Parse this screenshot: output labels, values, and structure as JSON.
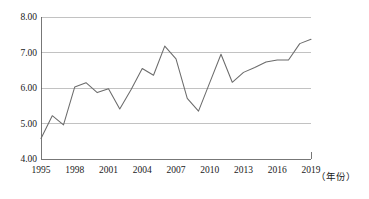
{
  "chart_data": {
    "type": "line",
    "title": "",
    "subtitle": "",
    "xlabel": "（年份）",
    "ylabel": "",
    "grid": true,
    "legend": false,
    "xlim": [
      1995,
      2019
    ],
    "ylim": [
      4.0,
      8.0
    ],
    "x_tick_labels": [
      "1995",
      "1998",
      "2001",
      "2004",
      "2007",
      "2010",
      "2013",
      "2016",
      "2019"
    ],
    "x_tick_values": [
      1995,
      1998,
      2001,
      2004,
      2007,
      2010,
      2013,
      2016,
      2019
    ],
    "y_tick_labels": [
      "4.00",
      "5.00",
      "6.00",
      "7.00",
      "8.00"
    ],
    "y_tick_values": [
      4.0,
      5.0,
      6.0,
      7.0,
      8.0
    ],
    "x": [
      1995,
      1996,
      1997,
      1998,
      1999,
      2000,
      2001,
      2002,
      2003,
      2004,
      2005,
      2006,
      2007,
      2008,
      2009,
      2010,
      2011,
      2012,
      2013,
      2014,
      2015,
      2016,
      2017,
      2018,
      2019
    ],
    "series": [
      {
        "name": "value",
        "color": "#6b6b6b",
        "values": [
          4.58,
          5.22,
          4.96,
          6.03,
          6.15,
          5.87,
          5.98,
          5.41,
          5.95,
          6.55,
          6.36,
          7.18,
          6.82,
          5.71,
          5.35,
          6.15,
          6.95,
          6.16,
          6.44,
          6.58,
          6.73,
          6.79,
          6.79,
          7.25,
          7.37
        ]
      }
    ],
    "values": [
      4.58,
      5.22,
      4.96,
      6.03,
      6.15,
      5.87,
      5.98,
      5.41,
      5.95,
      6.55,
      6.36,
      7.18,
      6.82,
      5.71,
      5.35,
      6.15,
      6.95,
      6.16,
      6.44,
      6.58,
      6.73,
      6.79,
      6.79,
      7.25,
      7.37
    ]
  },
  "axis": {
    "y_labels": [
      "8.00",
      "7.00",
      "6.00",
      "5.00",
      "4.00"
    ],
    "x_labels": [
      "1995",
      "1998",
      "2001",
      "2004",
      "2007",
      "2010",
      "2013",
      "2016",
      "2019"
    ],
    "x_axis_caption": "（年份）"
  }
}
